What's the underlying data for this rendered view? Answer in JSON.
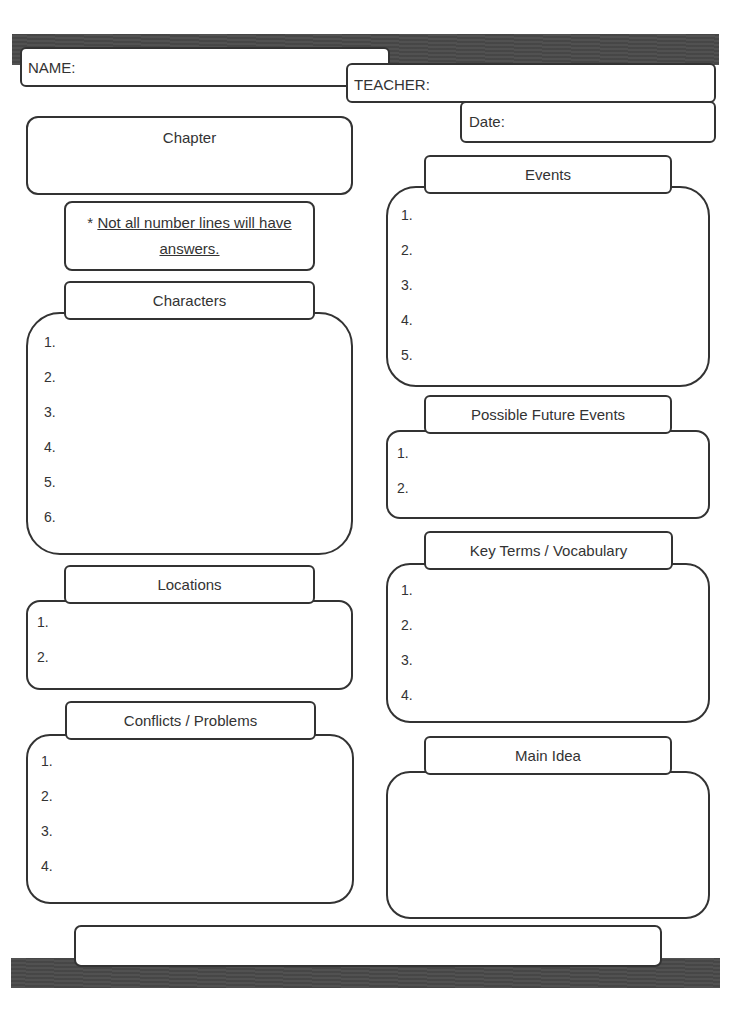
{
  "header": {
    "name_label": "NAME:",
    "teacher_label": "TEACHER:",
    "date_label": "Date:"
  },
  "chapter": {
    "label": "Chapter"
  },
  "note": {
    "asterisk": "*",
    "text_line1": "Not all number lines will have",
    "text_line2": "answers."
  },
  "sections": {
    "characters": {
      "title": "Characters",
      "items": [
        "1.",
        "2.",
        "3.",
        "4.",
        "5.",
        "6."
      ]
    },
    "locations": {
      "title": "Locations",
      "items": [
        "1.",
        "2."
      ]
    },
    "conflicts": {
      "title": "Conflicts / Problems",
      "items": [
        "1.",
        "2.",
        "3.",
        "4."
      ]
    },
    "events": {
      "title": "Events",
      "items": [
        "1.",
        "2.",
        "3.",
        "4.",
        "5."
      ]
    },
    "future_events": {
      "title": "Possible Future Events",
      "items": [
        "1.",
        "2."
      ]
    },
    "vocabulary": {
      "title": "Key Terms / Vocabulary",
      "items": [
        "1.",
        "2.",
        "3.",
        "4."
      ]
    },
    "main_idea": {
      "title": "Main Idea"
    }
  },
  "colors": {
    "banner": "#4a4a4a",
    "border": "#333333",
    "text": "#333333"
  }
}
